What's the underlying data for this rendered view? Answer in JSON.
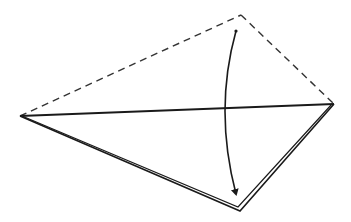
{
  "diagram": {
    "type": "origami-fold-step",
    "colors": {
      "line": "#1a1a1a",
      "background": "#ffffff"
    },
    "points": {
      "left": [
        20,
        116
      ],
      "right": [
        334,
        104
      ],
      "top": [
        241,
        15
      ],
      "bottom": [
        240,
        210
      ]
    },
    "arrow": {
      "start": [
        236,
        31
      ],
      "control": [
        218,
        110
      ],
      "end": [
        236,
        196
      ]
    }
  }
}
